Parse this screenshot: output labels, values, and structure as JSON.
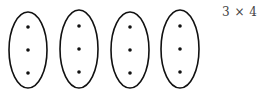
{
  "diagram": {
    "label": "3 × 4",
    "groups": [
      {
        "cx": 28,
        "cy": 50,
        "rx": 19,
        "ry": 38,
        "dots": 3
      },
      {
        "cx": 79,
        "cy": 49,
        "rx": 19,
        "ry": 39,
        "dots": 3
      },
      {
        "cx": 130,
        "cy": 50,
        "rx": 19,
        "ry": 38,
        "dots": 3
      },
      {
        "cx": 180,
        "cy": 49,
        "rx": 19,
        "ry": 39,
        "dots": 3
      }
    ],
    "dot_offsets_y": [
      -23,
      0,
      23
    ],
    "stroke_color": "#111111",
    "dot_color": "#111111"
  }
}
